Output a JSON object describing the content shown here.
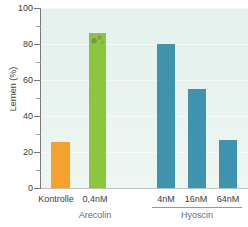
{
  "chart_data": {
    "type": "bar",
    "title": "",
    "xlabel": "",
    "ylabel": "Lernen (%)",
    "ylim": [
      0,
      100
    ],
    "yticks": [
      0,
      20,
      40,
      60,
      80,
      100
    ],
    "ytick_labels": [
      "0",
      "20",
      "40",
      "60",
      "80",
      "100"
    ],
    "yminor_ticks": [
      10,
      30,
      50,
      70,
      90
    ],
    "grid": true,
    "legend": "none",
    "plot_background": "#e7f2ee",
    "categories": [
      "Kontrolle",
      "0,4nM",
      "4nM",
      "16nM",
      "64nM"
    ],
    "values": [
      25.5,
      86,
      80,
      55,
      26.5
    ],
    "bar_colors": [
      "#f5a22c",
      "#8cc63e",
      "#3f93ad",
      "#3f93ad",
      "#3f93ad"
    ],
    "groups": [
      {
        "label": "Arecolin",
        "categories": [
          "0,4nM"
        ],
        "rule": false,
        "color": "#5b6c8a"
      },
      {
        "label": "Hyoscin",
        "categories": [
          "4nM",
          "16nM",
          "64nM"
        ],
        "rule": true,
        "color": "#5b6c8a"
      }
    ],
    "bars": [
      {
        "category": "Kontrolle",
        "value": 25.5,
        "color": "#f5a22c",
        "group": ""
      },
      {
        "category": "0,4nM",
        "value": 86,
        "color": "#8cc63e",
        "group": "Arecolin"
      },
      {
        "category": "4nM",
        "value": 80,
        "color": "#3f93ad",
        "group": "Hyoscin"
      },
      {
        "category": "16nM",
        "value": 55,
        "color": "#3f93ad",
        "group": "Hyoscin"
      },
      {
        "category": "64nM",
        "value": 26.5,
        "color": "#3f93ad",
        "group": "Hyoscin"
      }
    ]
  },
  "axis": {
    "y": {
      "label": "Lernen (%)",
      "tick_100": "100",
      "tick_80": "80",
      "tick_60": "60",
      "tick_40": "40",
      "tick_20": "20",
      "tick_0": "0"
    },
    "x": {
      "tick_kontrolle": "Kontrolle",
      "tick_04nm": "0,4nM",
      "tick_4nm": "4nM",
      "tick_16nm": "16nM",
      "tick_64nm": "64nM"
    }
  },
  "groups": {
    "arecolin": "Arecolin",
    "hyoscin": "Hyoscin"
  },
  "colors": {
    "orange": "#f5a22c",
    "green": "#8cc63e",
    "teal": "#3f93ad",
    "plot_bg": "#e7f2ee",
    "group_text": "#5b6c8a",
    "tick_text": "#3d3d3d"
  }
}
